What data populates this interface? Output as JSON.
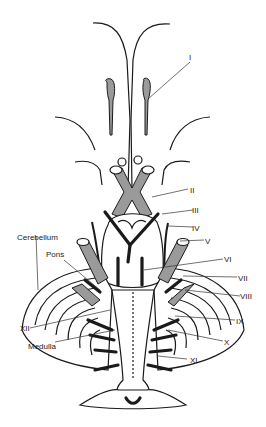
{
  "figure": {
    "colors": {
      "ink": "#1a1a1a",
      "nerve_fill": "#9a9a9a",
      "background": "#ffffff"
    }
  },
  "labels": {
    "I": "I",
    "II": "II",
    "III": "III",
    "IV": "IV",
    "V": "V",
    "VI": "VI",
    "VII": "VII",
    "VIII": "VIII",
    "IX": "IX",
    "X": "X",
    "XI": "XI",
    "XII": "XII",
    "pons": "Pons",
    "cerebellum": "Cerebellum",
    "medulla": "Medulla"
  }
}
